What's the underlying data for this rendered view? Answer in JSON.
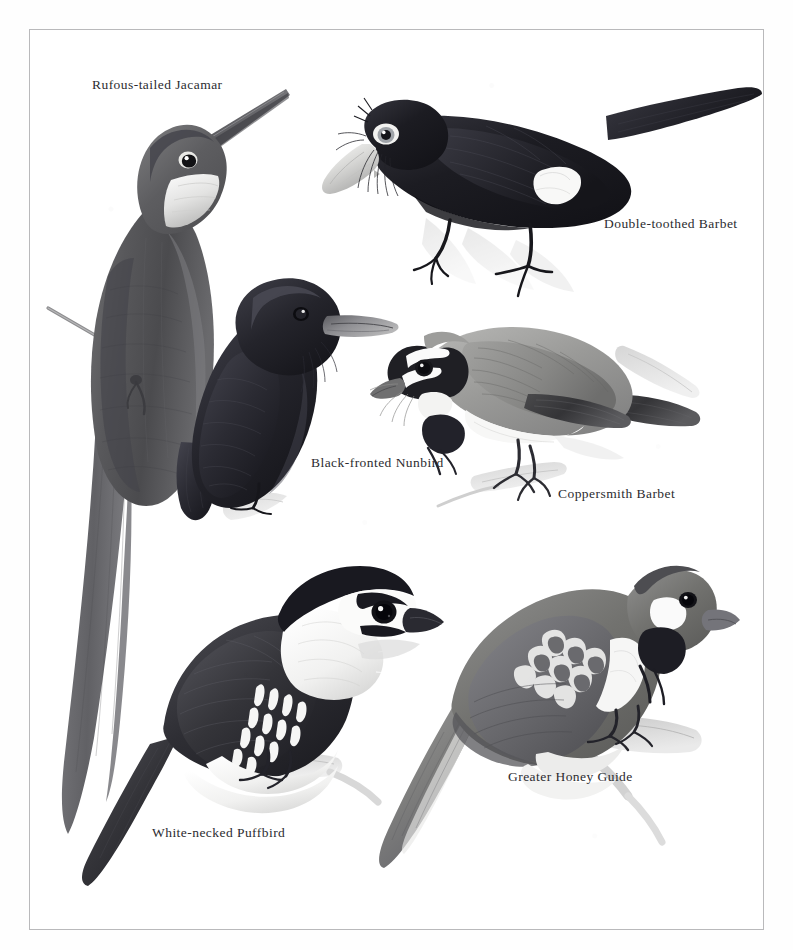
{
  "plate": {
    "kind": "field-guide-plate",
    "medium": "grayscale-illustration",
    "background_color": "#ffffff",
    "frame_color": "#b9b9bb",
    "ink_color": "#2c2c30",
    "width": 793,
    "height": 950
  },
  "species": [
    {
      "id": "rufous-tailed-jacamar",
      "label": "Rufous-tailed Jacamar",
      "label_x": 92,
      "label_y": 78,
      "pose": "perched-upright-front-facing-on-thin-twig",
      "notes": "very long straight needle bill, white throat patch, long graduated tail",
      "tone": "mid-gray"
    },
    {
      "id": "double-toothed-barbet",
      "label": "Double-toothed Barbet",
      "label_x": 604,
      "label_y": 217,
      "pose": "perched-leaning-forward-facing-left",
      "notes": "heavy pale ivory bill with rictal bristles, pale eye, white flank patch, blackish plumage",
      "tone": "near-black"
    },
    {
      "id": "black-fronted-nunbird",
      "label": "Black-fronted Nunbird",
      "label_x": 311,
      "label_y": 456,
      "pose": "perched-three-quarter-facing-right",
      "notes": "all sooty-black plumage, long pale dagger bill",
      "tone": "near-black"
    },
    {
      "id": "coppersmith-barbet",
      "label": "Coppersmith Barbet",
      "label_x": 558,
      "label_y": 487,
      "pose": "perched-horizontal-facing-left-on-branch",
      "notes": "bold black and white face pattern, pale gray mantle, dark wing bar",
      "tone": "light-gray"
    },
    {
      "id": "white-necked-puffbird",
      "label": "White-necked Puffbird",
      "label_x": 152,
      "label_y": 826,
      "pose": "perched-three-quarter-facing-right-on-branch",
      "notes": "white collar and throat, black cap and breast band, barred flanks, long tail",
      "tone": "black-and-white"
    },
    {
      "id": "greater-honey-guide",
      "label": "Greater Honey Guide",
      "label_x": 508,
      "label_y": 770,
      "pose": "perched-three-quarter-facing-right-on-branch",
      "notes": "black throat, white cheek patch, pale-edged wing coverts, long tail",
      "tone": "mid-gray"
    }
  ]
}
